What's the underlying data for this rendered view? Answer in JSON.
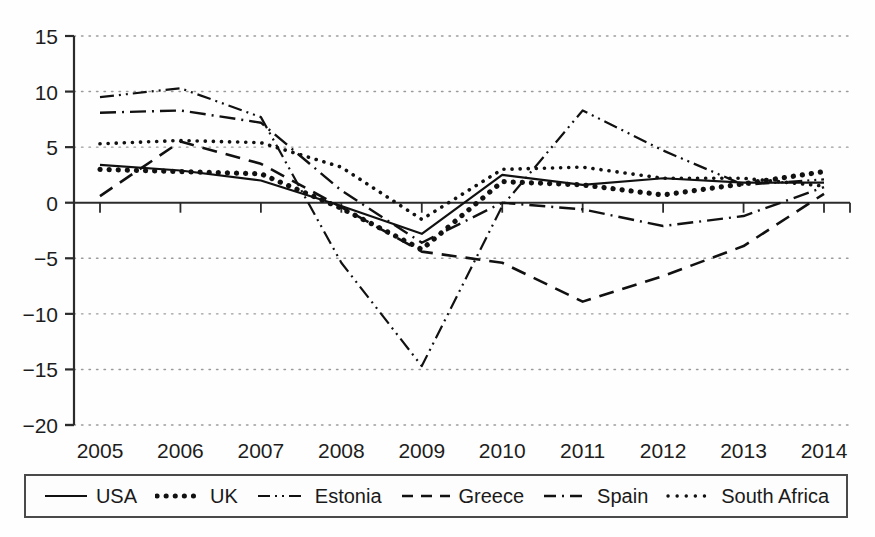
{
  "chart_data": {
    "type": "line",
    "title": "",
    "subtitle": "",
    "xlabel": "",
    "ylabel": "",
    "categories": [
      "2005",
      "2006",
      "2007",
      "2008",
      "2009",
      "2010",
      "2011",
      "2012",
      "2013",
      "2014"
    ],
    "x": [
      2005,
      2006,
      2007,
      2008,
      2009,
      2010,
      2011,
      2012,
      2013,
      2014
    ],
    "ylim": [
      -20,
      15
    ],
    "xlim": [
      2005,
      2014
    ],
    "yticks": [
      15,
      10,
      5,
      0,
      -5,
      -10,
      -15,
      -20
    ],
    "ytick_labels": [
      "15",
      "10",
      "5",
      "0",
      "−5",
      "−10",
      "−15",
      "−20"
    ],
    "xtick_labels": [
      "2005",
      "2006",
      "2007",
      "2008",
      "2009",
      "2010",
      "2011",
      "2012",
      "2013",
      "2014"
    ],
    "grid": true,
    "grid_style": "dotted-horizontal",
    "legend_position": "bottom",
    "zero_line": true,
    "series": [
      {
        "name": "USA",
        "style": "solid",
        "values": [
          3.4,
          2.9,
          2.0,
          -0.3,
          -2.8,
          2.5,
          1.6,
          2.2,
          1.8,
          1.8
        ]
      },
      {
        "name": "UK",
        "style": "thick-dotted",
        "values": [
          3.0,
          2.8,
          2.6,
          -0.5,
          -4.2,
          1.9,
          1.6,
          0.7,
          1.7,
          2.8
        ]
      },
      {
        "name": "Estonia",
        "style": "dash-dot-dot",
        "values": [
          9.5,
          10.3,
          7.7,
          -5.4,
          -14.7,
          -0.3,
          8.3,
          4.7,
          1.6,
          2.1
        ]
      },
      {
        "name": "Greece",
        "style": "dashed",
        "values": [
          0.6,
          5.5,
          3.5,
          -0.4,
          -4.4,
          -5.4,
          -8.9,
          -6.6,
          -3.9,
          0.8
        ]
      },
      {
        "name": "Spain",
        "style": "dash-dot",
        "values": [
          8.1,
          8.3,
          7.2,
          1.1,
          -3.6,
          0.0,
          -0.6,
          -2.1,
          -1.2,
          1.4
        ]
      },
      {
        "name": "South Africa",
        "style": "fine-dotted",
        "values": [
          5.3,
          5.6,
          5.4,
          3.2,
          -1.5,
          3.0,
          3.2,
          2.2,
          2.2,
          1.5
        ]
      }
    ],
    "colors": {
      "axis": "#2b2b2b",
      "grid": "#9a9a9a",
      "series": "#111111",
      "background": "#ffffff"
    }
  },
  "legend": {
    "items": [
      {
        "label": "USA",
        "style": "solid"
      },
      {
        "label": "UK",
        "style": "thick-dotted"
      },
      {
        "label": "Estonia",
        "style": "dash-dot-dot"
      },
      {
        "label": "Greece",
        "style": "dashed"
      },
      {
        "label": "Spain",
        "style": "dash-dot"
      },
      {
        "label": "South Africa",
        "style": "fine-dotted"
      }
    ]
  }
}
